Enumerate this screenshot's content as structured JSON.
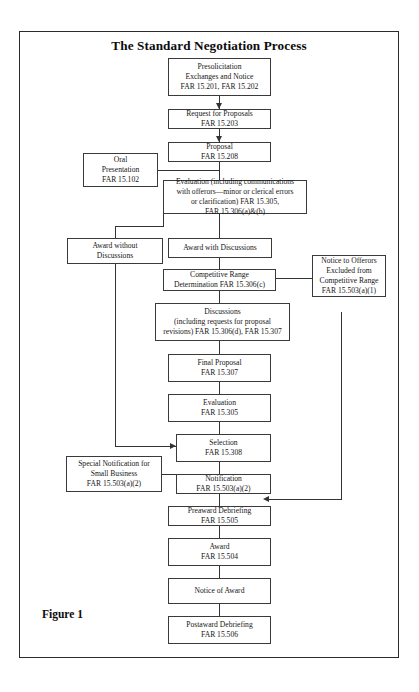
{
  "figure": {
    "title": "The Standard Negotiation Process",
    "caption": "Figure 1"
  },
  "nodes": {
    "presolicitation": {
      "line1": "Presolicitation",
      "line2": "Exchanges and Notice",
      "line3": "FAR 15.201, FAR 15.202"
    },
    "rfp": {
      "line1": "Request for Proposals",
      "line2": "FAR 15.203"
    },
    "proposal": {
      "line1": "Proposal",
      "line2": "FAR 15.208"
    },
    "oral_presentation": {
      "line1": "Oral",
      "line2": "Presentation",
      "line3": "FAR 15.102"
    },
    "evaluation_main": {
      "line1": "Evaluation (including communications",
      "line2": "with offerors—minor or clerical errors",
      "line3": "or clarification) FAR 15.305,",
      "line4": "FAR 15.306(a)&(b)"
    },
    "award_without_discussions": {
      "line1": "Award without",
      "line2": "Discussions"
    },
    "award_with_discussions": {
      "line1": "Award with Discussions"
    },
    "competitive_range": {
      "line1": "Competitive Range",
      "line2": "Determination FAR 15.306(c)"
    },
    "notice_to_offerors": {
      "line1": "Notice to Offerors",
      "line2": "Excluded from",
      "line3": "Competitive Range",
      "line4": "FAR 15.503(a)(1)"
    },
    "discussions": {
      "line1": "Discussions",
      "line2": "(including requests for proposal",
      "line3": "revisions) FAR 15.306(d), FAR 15.307"
    },
    "final_proposal": {
      "line1": "Final Proposal",
      "line2": "FAR 15.307"
    },
    "evaluation_second": {
      "line1": "Evaluation",
      "line2": "FAR 15.305"
    },
    "selection": {
      "line1": "Selection",
      "line2": "FAR 15.308"
    },
    "special_notification": {
      "line1": "Special Notification for",
      "line2": "Small Business",
      "line3": "FAR 15.503(a)(2)"
    },
    "notification": {
      "line1": "Notification",
      "line2": "FAR 15.503(a)(2)"
    },
    "preaward_debriefing": {
      "line1": "Preaward Debriefing",
      "line2": "FAR 15.505"
    },
    "award": {
      "line1": "Award",
      "line2": "FAR 15.504"
    },
    "notice_of_award": {
      "line1": "Notice of Award"
    },
    "postaward_debriefing": {
      "line1": "Postaward Debriefing",
      "line2": "FAR 15.506"
    }
  },
  "colors": {
    "box_border": "#3a3a3a",
    "connector": "#333333",
    "frame_border": "#2b2b2b",
    "background": "#ffffff",
    "text": "#161616"
  }
}
